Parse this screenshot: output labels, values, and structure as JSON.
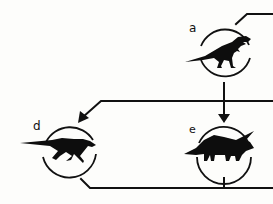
{
  "diagram": {
    "type": "evolutionary-relationship-diagram",
    "colors": {
      "line": "#111111",
      "silhouette": "#0d0d0d",
      "background": "#fdfdfb"
    },
    "nodes": [
      {
        "id": "a",
        "label": "a",
        "icon": "tyrannosaur-silhouette-icon"
      },
      {
        "id": "d",
        "label": "d",
        "icon": "hadrosaur-silhouette-icon"
      },
      {
        "id": "e",
        "label": "e",
        "icon": "triceratops-silhouette-icon"
      }
    ],
    "edges": [
      {
        "from": "a",
        "to": "e",
        "arrow": true
      },
      {
        "from": "right-offscreen",
        "to": "d",
        "arrow": true
      },
      {
        "from": "a",
        "to": "right-offscreen",
        "arrow": false
      },
      {
        "from": "d",
        "to": "right-offscreen",
        "arrow": false
      },
      {
        "from": "e",
        "to": "right-offscreen",
        "arrow": false
      }
    ]
  }
}
